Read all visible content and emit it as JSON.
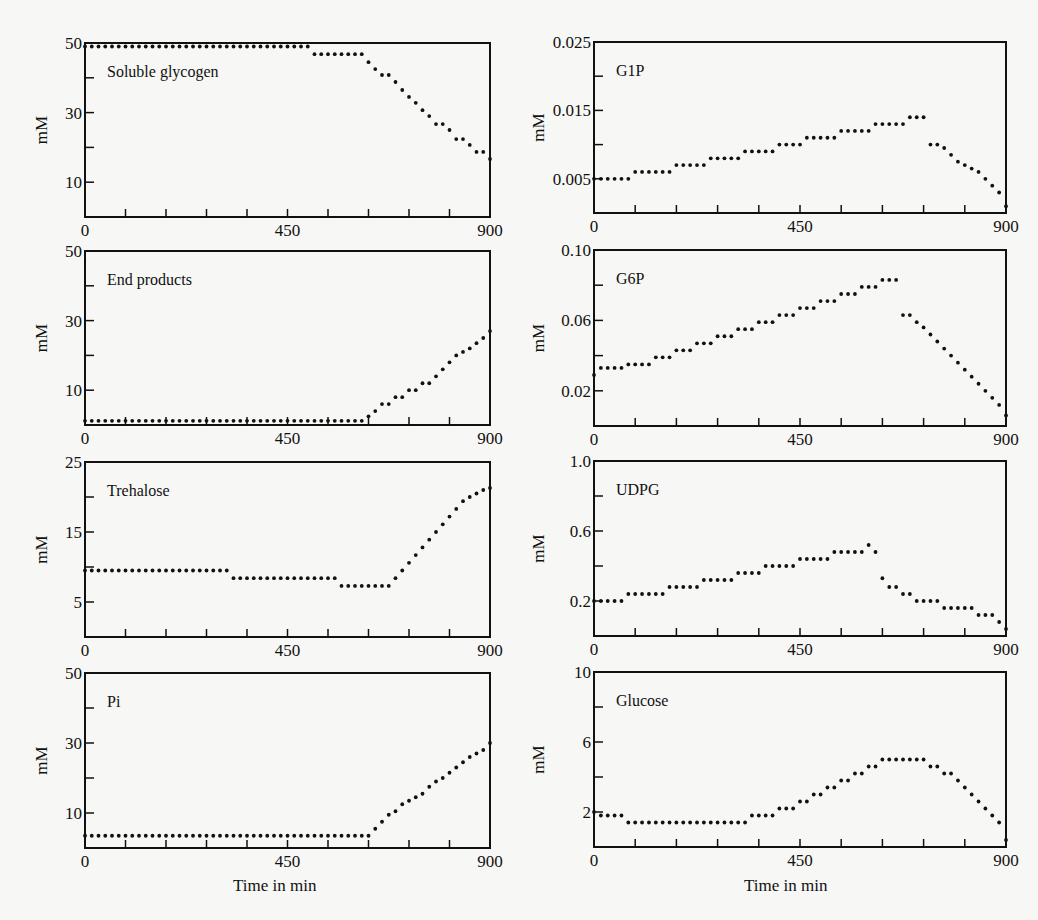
{
  "figure": {
    "xlabel": "Time in min",
    "ylabel": "mM"
  },
  "chart_data": [
    {
      "type": "scatter",
      "title": "Soluble glycogen",
      "xlabel": "",
      "ylabel": "mM",
      "xlim": [
        0,
        900
      ],
      "ylim": [
        0,
        50
      ],
      "xticks": [
        0,
        450,
        900
      ],
      "yticks_labeled": [
        10,
        30,
        50
      ],
      "yticks_minor": [
        20,
        40
      ],
      "x": "0..900 step 15",
      "values": [
        49,
        49,
        49,
        49,
        49,
        49,
        49,
        49,
        49,
        49,
        49,
        49,
        49,
        49,
        49,
        49,
        49,
        49,
        49,
        49,
        49,
        49,
        49,
        49,
        49,
        49,
        49,
        49,
        49,
        49,
        49,
        49,
        49,
        49,
        46.8,
        46.8,
        46.8,
        46.8,
        46.8,
        46.8,
        46.8,
        46.8,
        44.5,
        42.5,
        40.8,
        40.8,
        38.8,
        36.5,
        34.5,
        32.8,
        30.7,
        29,
        26.7,
        26.7,
        25,
        22.4,
        22.4,
        20.7,
        18.7,
        18.7,
        16.7
      ],
      "panel": {
        "left": 85,
        "top": 43,
        "right": 490,
        "bottom": 217,
        "col": 0
      }
    },
    {
      "type": "scatter",
      "title": "G1P",
      "xlabel": "",
      "ylabel": "mM",
      "xlim": [
        0,
        900
      ],
      "ylim": [
        0,
        0.025
      ],
      "xticks": [
        0,
        450,
        900
      ],
      "yticks_labeled": [
        0.005,
        0.015,
        0.025
      ],
      "yticks_minor": [
        0.01,
        0.02
      ],
      "x": "0..900 step 15",
      "values": [
        0.005,
        0.005,
        0.005,
        0.005,
        0.005,
        0.005,
        0.006,
        0.006,
        0.006,
        0.006,
        0.006,
        0.006,
        0.007,
        0.007,
        0.007,
        0.007,
        0.007,
        0.008,
        0.008,
        0.008,
        0.008,
        0.008,
        0.009,
        0.009,
        0.009,
        0.009,
        0.009,
        0.01,
        0.01,
        0.01,
        0.01,
        0.011,
        0.011,
        0.011,
        0.011,
        0.011,
        0.012,
        0.012,
        0.012,
        0.012,
        0.012,
        0.013,
        0.013,
        0.013,
        0.013,
        0.013,
        0.014,
        0.014,
        0.014,
        0.01,
        0.01,
        0.0095,
        0.0085,
        0.0075,
        0.007,
        0.0065,
        0.006,
        0.005,
        0.004,
        0.003,
        0.001
      ],
      "panel": {
        "left": 594,
        "top": 42,
        "right": 1006,
        "bottom": 213,
        "col": 1
      }
    },
    {
      "type": "scatter",
      "title": "End products",
      "xlabel": "",
      "ylabel": "mM",
      "xlim": [
        0,
        900
      ],
      "ylim": [
        0,
        50
      ],
      "xticks": [
        0,
        450,
        900
      ],
      "yticks_labeled": [
        10,
        30,
        50
      ],
      "yticks_minor": [
        20,
        40
      ],
      "x": "0..900 step 15",
      "values": [
        1.2,
        1.2,
        1.2,
        1.2,
        1.2,
        1.2,
        1.2,
        1.2,
        1.2,
        1.2,
        1.2,
        1.2,
        1.2,
        1.2,
        1.2,
        1.2,
        1.2,
        1.2,
        1.2,
        1.2,
        1.2,
        1.2,
        1.2,
        1.2,
        1.2,
        1.2,
        1.2,
        1.2,
        1.2,
        1.2,
        1.2,
        1.2,
        1.2,
        1.2,
        1.2,
        1.2,
        1.2,
        1.2,
        1.2,
        1.2,
        1.2,
        1.2,
        2.5,
        4,
        6,
        6,
        8,
        8,
        10,
        10,
        12,
        12,
        14,
        16,
        18,
        20,
        21,
        22,
        23.5,
        25,
        27
      ],
      "panel": {
        "left": 85,
        "top": 251,
        "right": 490,
        "bottom": 425,
        "col": 0
      }
    },
    {
      "type": "scatter",
      "title": "G6P",
      "xlabel": "",
      "ylabel": "mM",
      "xlim": [
        0,
        900
      ],
      "ylim": [
        0,
        0.1
      ],
      "xticks": [
        0,
        450,
        900
      ],
      "yticks_labeled": [
        0.02,
        0.06,
        0.1
      ],
      "yticks_minor": [
        0.04,
        0.08
      ],
      "x": "0..900 step 15",
      "values": [
        0.029,
        0.033,
        0.033,
        0.033,
        0.033,
        0.035,
        0.035,
        0.035,
        0.035,
        0.039,
        0.039,
        0.039,
        0.043,
        0.043,
        0.043,
        0.047,
        0.047,
        0.047,
        0.051,
        0.051,
        0.051,
        0.055,
        0.055,
        0.055,
        0.059,
        0.059,
        0.059,
        0.063,
        0.063,
        0.063,
        0.067,
        0.067,
        0.067,
        0.071,
        0.071,
        0.071,
        0.075,
        0.075,
        0.075,
        0.079,
        0.079,
        0.079,
        0.083,
        0.083,
        0.083,
        0.063,
        0.063,
        0.059,
        0.056,
        0.052,
        0.048,
        0.044,
        0.04,
        0.036,
        0.032,
        0.028,
        0.024,
        0.02,
        0.016,
        0.012,
        0.006
      ],
      "panel": {
        "left": 594,
        "top": 250,
        "right": 1006,
        "bottom": 426,
        "col": 1
      }
    },
    {
      "type": "scatter",
      "title": "Trehalose",
      "xlabel": "",
      "ylabel": "mM",
      "xlim": [
        0,
        900
      ],
      "ylim": [
        0,
        25
      ],
      "xticks": [
        0,
        450,
        900
      ],
      "yticks_labeled": [
        5,
        15,
        25
      ],
      "yticks_minor": [
        10,
        20
      ],
      "x": "0..900 step 15",
      "values": [
        9.5,
        9.5,
        9.5,
        9.5,
        9.5,
        9.5,
        9.5,
        9.5,
        9.5,
        9.5,
        9.5,
        9.5,
        9.5,
        9.5,
        9.5,
        9.5,
        9.5,
        9.5,
        9.5,
        9.5,
        9.5,
        9.5,
        8.4,
        8.4,
        8.4,
        8.4,
        8.4,
        8.4,
        8.4,
        8.4,
        8.4,
        8.4,
        8.4,
        8.4,
        8.4,
        8.4,
        8.4,
        8.4,
        7.3,
        7.3,
        7.3,
        7.3,
        7.3,
        7.3,
        7.3,
        7.3,
        8.4,
        9.5,
        10.6,
        11.7,
        12.8,
        13.9,
        15,
        16.1,
        17.2,
        18.3,
        19.4,
        20,
        20.5,
        21,
        21.3
      ],
      "panel": {
        "left": 85,
        "top": 462,
        "right": 490,
        "bottom": 637,
        "col": 0
      }
    },
    {
      "type": "scatter",
      "title": "UDPG",
      "xlabel": "",
      "ylabel": "mM",
      "xlim": [
        0,
        900
      ],
      "ylim": [
        0,
        1.0
      ],
      "xticks": [
        0,
        450,
        900
      ],
      "yticks_labeled": [
        0.2,
        0.6,
        1.0
      ],
      "yticks_minor": [
        0.4,
        0.8
      ],
      "x": "0..900 step 15",
      "values": [
        0.2,
        0.2,
        0.2,
        0.2,
        0.2,
        0.24,
        0.24,
        0.24,
        0.24,
        0.24,
        0.24,
        0.28,
        0.28,
        0.28,
        0.28,
        0.28,
        0.32,
        0.32,
        0.32,
        0.32,
        0.32,
        0.36,
        0.36,
        0.36,
        0.36,
        0.4,
        0.4,
        0.4,
        0.4,
        0.4,
        0.44,
        0.44,
        0.44,
        0.44,
        0.44,
        0.48,
        0.48,
        0.48,
        0.48,
        0.48,
        0.52,
        0.48,
        0.33,
        0.28,
        0.28,
        0.24,
        0.24,
        0.2,
        0.2,
        0.2,
        0.2,
        0.16,
        0.16,
        0.16,
        0.16,
        0.16,
        0.12,
        0.12,
        0.12,
        0.08,
        0.04
      ],
      "panel": {
        "left": 594,
        "top": 461,
        "right": 1006,
        "bottom": 636,
        "col": 1
      }
    },
    {
      "type": "scatter",
      "title": "Pi",
      "xlabel": "Time in min",
      "ylabel": "mM",
      "xlim": [
        0,
        900
      ],
      "ylim": [
        0,
        50
      ],
      "xticks": [
        0,
        450,
        900
      ],
      "yticks_labeled": [
        10,
        30,
        50
      ],
      "yticks_minor": [
        20,
        40
      ],
      "x": "0..900 step 15",
      "values": [
        3.5,
        3.5,
        3.5,
        3.5,
        3.5,
        3.5,
        3.5,
        3.5,
        3.5,
        3.5,
        3.5,
        3.5,
        3.5,
        3.5,
        3.5,
        3.5,
        3.5,
        3.5,
        3.5,
        3.5,
        3.5,
        3.5,
        3.5,
        3.5,
        3.5,
        3.5,
        3.5,
        3.5,
        3.5,
        3.5,
        3.5,
        3.5,
        3.5,
        3.5,
        3.5,
        3.5,
        3.5,
        3.5,
        3.5,
        3.5,
        3.5,
        3.5,
        3.5,
        5.5,
        7.5,
        9.5,
        10.5,
        12.5,
        13.5,
        14.5,
        15.5,
        17.5,
        19,
        20,
        21.5,
        23,
        24.5,
        26,
        27,
        28,
        30
      ],
      "panel": {
        "left": 85,
        "top": 673,
        "right": 490,
        "bottom": 848,
        "col": 0
      }
    },
    {
      "type": "scatter",
      "title": "Glucose",
      "xlabel": "Time in min",
      "ylabel": "mM",
      "xlim": [
        0,
        900
      ],
      "ylim": [
        0,
        10
      ],
      "xticks": [
        0,
        450,
        900
      ],
      "yticks_labeled": [
        2,
        6,
        10
      ],
      "yticks_minor": [
        4,
        8
      ],
      "x": "0..900 step 15",
      "values": [
        2,
        1.8,
        1.8,
        1.8,
        1.8,
        1.4,
        1.4,
        1.4,
        1.4,
        1.4,
        1.4,
        1.4,
        1.4,
        1.4,
        1.4,
        1.4,
        1.4,
        1.4,
        1.4,
        1.4,
        1.4,
        1.4,
        1.4,
        1.8,
        1.8,
        1.8,
        1.8,
        2.2,
        2.2,
        2.2,
        2.6,
        2.6,
        3,
        3,
        3.4,
        3.4,
        3.8,
        3.8,
        4.2,
        4.2,
        4.6,
        4.6,
        5,
        5,
        5,
        5,
        5,
        5,
        5,
        4.6,
        4.6,
        4.2,
        4.2,
        3.8,
        3.4,
        3,
        2.6,
        2.2,
        1.8,
        1.4,
        0.4
      ],
      "panel": {
        "left": 594,
        "top": 672,
        "right": 1006,
        "bottom": 847,
        "col": 1
      }
    }
  ],
  "colors": {
    "background": "#f7f7f5",
    "ink": "#111111"
  }
}
